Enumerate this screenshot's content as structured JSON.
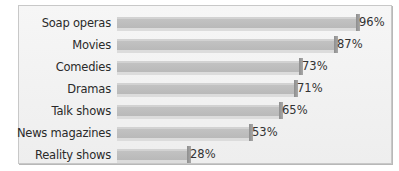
{
  "chart_data": {
    "type": "bar",
    "orientation": "horizontal",
    "title": "",
    "xlabel": "",
    "ylabel": "",
    "xlim": [
      0,
      100
    ],
    "grid": false,
    "legend": null,
    "categories": [
      "Soap operas",
      "Movies",
      "Comedies",
      "Dramas",
      "Talk shows",
      "News magazines",
      "Reality shows"
    ],
    "values": [
      96,
      87,
      73,
      71,
      65,
      53,
      28
    ],
    "value_labels": [
      "96%",
      "87%",
      "73%",
      "71%",
      "65%",
      "53%",
      "28%"
    ],
    "unit": "%"
  },
  "rows": [
    {
      "label": "Soap operas",
      "value": 96,
      "value_label": "96%"
    },
    {
      "label": "Movies",
      "value": 87,
      "value_label": "87%"
    },
    {
      "label": "Comedies",
      "value": 73,
      "value_label": "73%"
    },
    {
      "label": "Dramas",
      "value": 71,
      "value_label": "71%"
    },
    {
      "label": "Talk shows",
      "value": 65,
      "value_label": "65%"
    },
    {
      "label": "News magazines",
      "value": 53,
      "value_label": "53%"
    },
    {
      "label": "Reality shows",
      "value": 28,
      "value_label": "28%"
    }
  ],
  "colors": {
    "bar": "#bdbdbd",
    "bar_end": "#999999",
    "panel": "#f2f2f2",
    "text": "#2a2a2a"
  }
}
